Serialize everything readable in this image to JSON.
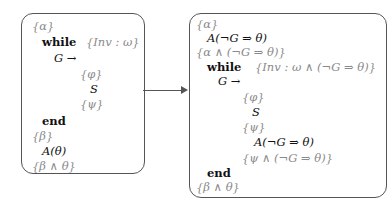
{
  "left_program": {
    "lines": [
      {
        "text": "{α}",
        "kind": "annotation",
        "indent": 0
      },
      {
        "text": "while",
        "kind": "keyword",
        "indent": 1
      },
      {
        "text": "{Inv : ω}",
        "kind": "annotation",
        "indent": 5
      },
      {
        "text": "G →",
        "kind": "math",
        "indent": 2
      },
      {
        "text": "{φ}",
        "kind": "annotation",
        "indent": 4
      },
      {
        "text": "S",
        "kind": "math",
        "indent": 4
      },
      {
        "text": "{ψ}",
        "kind": "annotation",
        "indent": 4
      },
      {
        "text": "end",
        "kind": "keyword",
        "indent": 1
      },
      {
        "text": "{β}",
        "kind": "annotation",
        "indent": 0
      },
      {
        "text": "A(θ)",
        "kind": "math",
        "indent": 1
      },
      {
        "text": "{β ∧ θ}",
        "kind": "annotation",
        "indent": 0
      }
    ]
  },
  "right_program": {
    "lines": [
      {
        "text": "{α}",
        "kind": "annotation"
      },
      {
        "text": "A(¬G ⇒ θ)",
        "kind": "math"
      },
      {
        "text": "{α ∧ (¬G ⇒ θ)}",
        "kind": "annotation"
      },
      {
        "text": "while",
        "kind": "keyword"
      },
      {
        "text": "{Inv : ω ∧ (¬G ⇒ θ)}",
        "kind": "annotation"
      },
      {
        "text": "G →",
        "kind": "math"
      },
      {
        "text": "{φ}",
        "kind": "annotation"
      },
      {
        "text": "S",
        "kind": "math"
      },
      {
        "text": "{ψ}",
        "kind": "annotation"
      },
      {
        "text": "A(¬G ⇒ θ)",
        "kind": "math"
      },
      {
        "text": "{ψ ∧ (¬G ⇒ θ)}",
        "kind": "annotation"
      },
      {
        "text": "end",
        "kind": "keyword"
      },
      {
        "text": "{β ∧ θ}",
        "kind": "annotation"
      }
    ]
  },
  "connector": {
    "direction": "left-to-right",
    "color": "#555555"
  },
  "colors": {
    "annotation": "#8a8a8a",
    "code": "#111111",
    "border": "#555555"
  }
}
